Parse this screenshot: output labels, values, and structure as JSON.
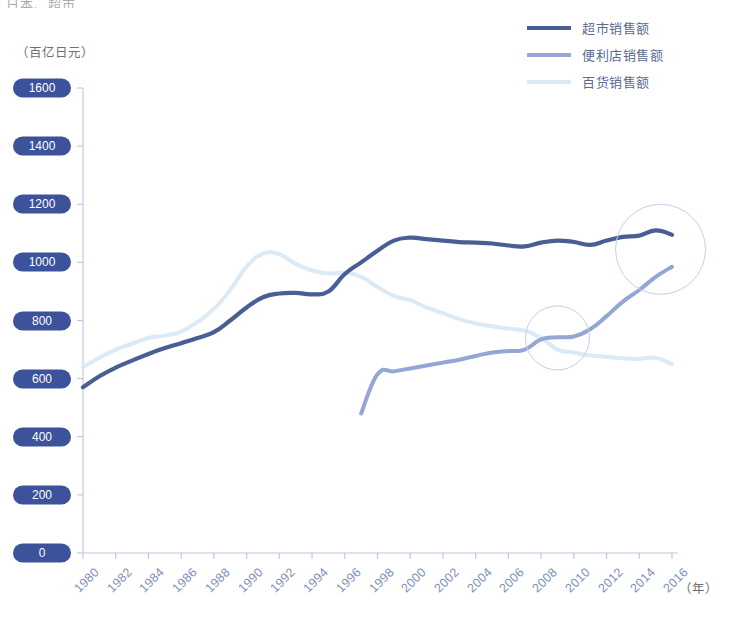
{
  "page": {
    "top_cropped_text": "日本、超市",
    "y_unit": "（百亿日元）",
    "x_unit": "（年）"
  },
  "colors": {
    "supermarket": "#4a5e96",
    "convenience": "#93a6d4",
    "department": "#daeaf7",
    "axis": "#b9c6dd",
    "pill_bg": "#3c529a",
    "pill_text": "#ffffff",
    "tick_text": "#8091b5",
    "annotation_circle": "#c7cfe3"
  },
  "legend": {
    "position": "top-right",
    "items": [
      {
        "label": "超市销售额",
        "key": "supermarket"
      },
      {
        "label": "便利店销售额",
        "key": "convenience"
      },
      {
        "label": "百货销售额",
        "key": "department"
      }
    ]
  },
  "chart_data": {
    "type": "line",
    "title": "",
    "subtitle": "",
    "xlabel": "（年）",
    "ylabel": "（百亿日元）",
    "xlim": [
      1980,
      2016
    ],
    "ylim": [
      0,
      1600
    ],
    "ytick_step": 200,
    "xtick_step": 2,
    "grid": false,
    "yticks": [
      0,
      200,
      400,
      600,
      800,
      1000,
      1200,
      1400,
      1600
    ],
    "xticks": [
      1980,
      1982,
      1984,
      1986,
      1988,
      1990,
      1992,
      1994,
      1996,
      1998,
      2000,
      2002,
      2004,
      2006,
      2008,
      2010,
      2012,
      2014,
      2016
    ],
    "legend_position": "top-right",
    "series": [
      {
        "name": "超市销售额",
        "key": "supermarket",
        "color": "#4a5e96",
        "width": 4.2,
        "x": [
          1980,
          1981,
          1982,
          1983,
          1984,
          1985,
          1986,
          1987,
          1988,
          1989,
          1990,
          1991,
          1992,
          1993,
          1994,
          1995,
          1996,
          1997,
          1998,
          1999,
          2000,
          2001,
          2002,
          2003,
          2004,
          2005,
          2006,
          2007,
          2008,
          2009,
          2010,
          2011,
          2012,
          2013,
          2014,
          2015,
          2016
        ],
        "values": [
          570,
          608,
          638,
          662,
          685,
          705,
          722,
          740,
          760,
          800,
          845,
          880,
          893,
          895,
          890,
          900,
          960,
          1000,
          1040,
          1075,
          1085,
          1080,
          1075,
          1070,
          1068,
          1065,
          1058,
          1055,
          1068,
          1075,
          1070,
          1060,
          1075,
          1088,
          1092,
          1110,
          1095
        ]
      },
      {
        "name": "便利店销售额",
        "key": "convenience",
        "color": "#93a6d4",
        "width": 4.0,
        "x": [
          1997,
          1998,
          1999,
          2000,
          2001,
          2002,
          2003,
          2004,
          2005,
          2006,
          2007,
          2008,
          2009,
          2010,
          2011,
          2012,
          2013,
          2014,
          2015,
          2016
        ],
        "values": [
          480,
          615,
          625,
          635,
          645,
          655,
          665,
          678,
          690,
          695,
          700,
          735,
          742,
          745,
          770,
          815,
          865,
          905,
          950,
          985
        ]
      },
      {
        "name": "百货销售额",
        "key": "department",
        "color": "#daeaf7",
        "width": 4.0,
        "x": [
          1980,
          1981,
          1982,
          1983,
          1984,
          1985,
          1986,
          1987,
          1988,
          1989,
          1990,
          1991,
          1992,
          1993,
          1994,
          1995,
          1996,
          1997,
          1998,
          1999,
          2000,
          2001,
          2002,
          2003,
          2004,
          2005,
          2006,
          2007,
          2008,
          2009,
          2010,
          2011,
          2012,
          2013,
          2014,
          2015,
          2016
        ],
        "values": [
          640,
          672,
          700,
          720,
          740,
          748,
          762,
          795,
          840,
          905,
          985,
          1030,
          1028,
          995,
          972,
          962,
          965,
          950,
          915,
          885,
          870,
          845,
          825,
          805,
          790,
          780,
          772,
          765,
          740,
          700,
          690,
          680,
          675,
          670,
          668,
          672,
          650
        ]
      }
    ],
    "annotations": [
      {
        "name": "crossing-convenience-department",
        "x": 2009,
        "y": 740,
        "radius_px": 32
      },
      {
        "name": "crossing-supermarket-convenience",
        "x": 2015.3,
        "y": 1045,
        "radius_px": 45
      }
    ]
  }
}
